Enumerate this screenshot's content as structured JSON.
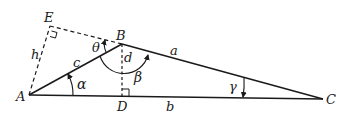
{
  "diagram": {
    "type": "geometry-triangle",
    "colors": {
      "stroke": "#1a1a1a",
      "background": "#ffffff"
    },
    "points": {
      "A": {
        "label": "A"
      },
      "B": {
        "label": "B"
      },
      "C": {
        "label": "C"
      },
      "D": {
        "label": "D"
      },
      "E": {
        "label": "E"
      }
    },
    "sides": {
      "a": "a",
      "b": "b",
      "c": "c",
      "d": "d",
      "h": "h"
    },
    "angles": {
      "alpha": "α",
      "beta": "β",
      "gamma": "γ",
      "theta": "θ"
    },
    "segments": [
      {
        "from": "A",
        "to": "B",
        "style": "solid",
        "label": "c"
      },
      {
        "from": "B",
        "to": "C",
        "style": "solid",
        "label": "a"
      },
      {
        "from": "A",
        "to": "C",
        "style": "solid",
        "label": "b"
      },
      {
        "from": "B",
        "to": "D",
        "style": "dashed",
        "label": "d"
      },
      {
        "from": "A",
        "to": "E",
        "style": "dashed",
        "label": "h"
      },
      {
        "from": "E",
        "to": "B",
        "style": "dashed",
        "label": ""
      }
    ],
    "right_angles": [
      "E",
      "D"
    ]
  }
}
